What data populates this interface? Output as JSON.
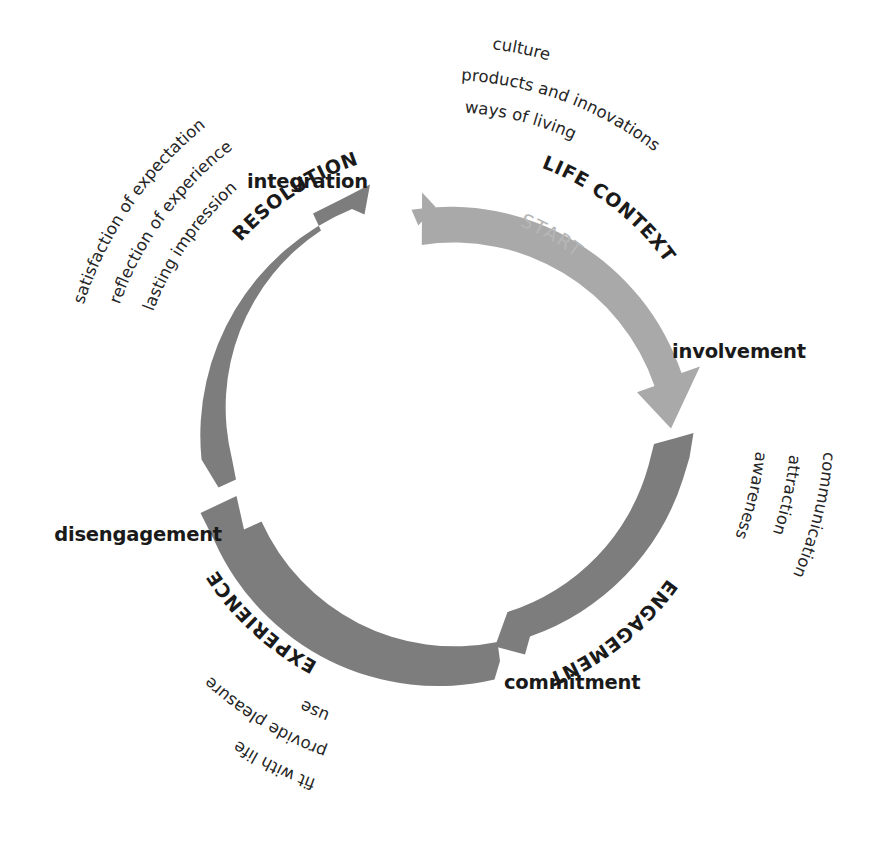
{
  "diagram": {
    "type": "cyclical-process-diagram",
    "start_marker": "START",
    "colors": {
      "arc_light": "#a9a9a9",
      "arc_dark": "#7d7d7d",
      "text_dark": "#1a1a1a",
      "text_muted": "#b6b6b6",
      "background": "#ffffff"
    },
    "nodes": [
      {
        "id": "integration",
        "label": "integration"
      },
      {
        "id": "involvement",
        "label": "involvement"
      },
      {
        "id": "commitment",
        "label": "commitment"
      },
      {
        "id": "disengagement",
        "label": "disengagement"
      }
    ],
    "phases": [
      {
        "id": "life-context",
        "label": "LIFE CONTEXT",
        "color": "#a9a9a9",
        "from": "integration",
        "to": "involvement",
        "descriptors": [
          "culture",
          "products and innovations",
          "ways of living"
        ]
      },
      {
        "id": "engagement",
        "label": "ENGAGEMENT",
        "color": "#7d7d7d",
        "from": "involvement",
        "to": "commitment",
        "descriptors": [
          "awareness",
          "attraction",
          "communication"
        ]
      },
      {
        "id": "experience",
        "label": "EXPERIENCE",
        "color": "#7d7d7d",
        "from": "commitment",
        "to": "disengagement",
        "descriptors": [
          "use",
          "provide pleasure",
          "fit with life"
        ]
      },
      {
        "id": "resolution",
        "label": "RESOLUTION",
        "color": "#7d7d7d",
        "from": "disengagement",
        "to": "integration",
        "descriptors": [
          "lasting impression",
          "reflection of experience",
          "satisfaction of expectation"
        ]
      }
    ]
  }
}
